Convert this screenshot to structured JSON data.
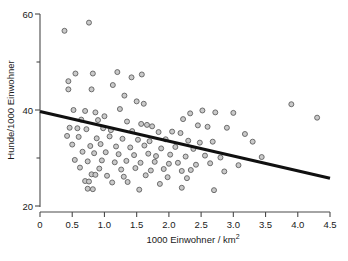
{
  "chart_data": {
    "type": "scatter",
    "title": "",
    "xlabel": "1000 Einwohner / km",
    "xlabel_sup": "2",
    "ylabel": "Hunde/1000 Einwohner",
    "xlim": [
      0,
      4.5
    ],
    "ylim": [
      18,
      61
    ],
    "grid": false,
    "legend": null,
    "xticks": [
      0,
      0.5,
      1.0,
      1.5,
      2.0,
      2.5,
      3.0,
      3.5,
      4.0,
      4.5
    ],
    "xticklabels": [
      "0",
      "0.5",
      "1.0",
      "1.5",
      "2.0",
      "2.5",
      "3.0",
      "3.5",
      "4.0",
      "4.5"
    ],
    "yticks": [
      20,
      40,
      60
    ],
    "yticklabels": [
      "20",
      "40",
      "60"
    ],
    "y_minor_ticks": [
      30,
      50
    ],
    "marker": "open-circle",
    "marker_fill": "#c9c9c9",
    "marker_edge": "#585858",
    "trendline": {
      "label": "regression-line",
      "color": "#101010",
      "x": [
        0.0,
        4.5
      ],
      "y": [
        39.7,
        25.8
      ]
    },
    "points": [
      {
        "x": 0.38,
        "y": 56.5
      },
      {
        "x": 0.76,
        "y": 58.2
      },
      {
        "x": 0.55,
        "y": 47.6
      },
      {
        "x": 0.44,
        "y": 46.0
      },
      {
        "x": 0.44,
        "y": 44.3
      },
      {
        "x": 0.82,
        "y": 47.6
      },
      {
        "x": 0.8,
        "y": 44.3
      },
      {
        "x": 1.2,
        "y": 47.9
      },
      {
        "x": 1.13,
        "y": 45.2
      },
      {
        "x": 1.58,
        "y": 47.4
      },
      {
        "x": 1.42,
        "y": 46.8
      },
      {
        "x": 1.31,
        "y": 43.0
      },
      {
        "x": 1.5,
        "y": 41.8
      },
      {
        "x": 1.61,
        "y": 41.3
      },
      {
        "x": 3.9,
        "y": 41.2
      },
      {
        "x": 0.52,
        "y": 40.0
      },
      {
        "x": 0.7,
        "y": 39.8
      },
      {
        "x": 0.86,
        "y": 39.5
      },
      {
        "x": 1.0,
        "y": 38.7
      },
      {
        "x": 1.24,
        "y": 40.2
      },
      {
        "x": 2.33,
        "y": 39.3
      },
      {
        "x": 2.52,
        "y": 39.9
      },
      {
        "x": 2.72,
        "y": 39.5
      },
      {
        "x": 3.0,
        "y": 39.4
      },
      {
        "x": 2.22,
        "y": 38.1
      },
      {
        "x": 4.3,
        "y": 38.4
      },
      {
        "x": 0.64,
        "y": 38.0
      },
      {
        "x": 0.9,
        "y": 37.9
      },
      {
        "x": 1.35,
        "y": 37.6
      },
      {
        "x": 1.57,
        "y": 37.1
      },
      {
        "x": 1.66,
        "y": 36.9
      },
      {
        "x": 1.74,
        "y": 36.6
      },
      {
        "x": 2.45,
        "y": 36.8
      },
      {
        "x": 2.6,
        "y": 36.5
      },
      {
        "x": 0.46,
        "y": 36.3
      },
      {
        "x": 0.58,
        "y": 36.2
      },
      {
        "x": 0.72,
        "y": 36.0
      },
      {
        "x": 0.98,
        "y": 36.2
      },
      {
        "x": 1.1,
        "y": 35.8
      },
      {
        "x": 1.43,
        "y": 35.6
      },
      {
        "x": 1.84,
        "y": 35.4
      },
      {
        "x": 2.05,
        "y": 35.5
      },
      {
        "x": 2.18,
        "y": 35.2
      },
      {
        "x": 2.9,
        "y": 36.3
      },
      {
        "x": 3.18,
        "y": 35.0
      },
      {
        "x": 0.42,
        "y": 34.6
      },
      {
        "x": 0.6,
        "y": 34.4
      },
      {
        "x": 0.88,
        "y": 34.1
      },
      {
        "x": 1.08,
        "y": 34.5
      },
      {
        "x": 1.28,
        "y": 34.0
      },
      {
        "x": 1.52,
        "y": 33.8
      },
      {
        "x": 1.7,
        "y": 33.5
      },
      {
        "x": 1.95,
        "y": 33.9
      },
      {
        "x": 2.3,
        "y": 33.6
      },
      {
        "x": 2.48,
        "y": 33.2
      },
      {
        "x": 2.68,
        "y": 33.4
      },
      {
        "x": 3.3,
        "y": 33.4
      },
      {
        "x": 0.5,
        "y": 32.8
      },
      {
        "x": 0.78,
        "y": 32.5
      },
      {
        "x": 0.94,
        "y": 32.9
      },
      {
        "x": 1.18,
        "y": 32.4
      },
      {
        "x": 1.4,
        "y": 32.2
      },
      {
        "x": 1.62,
        "y": 32.6
      },
      {
        "x": 1.88,
        "y": 32.0
      },
      {
        "x": 2.1,
        "y": 32.3
      },
      {
        "x": 2.38,
        "y": 31.9
      },
      {
        "x": 0.66,
        "y": 31.3
      },
      {
        "x": 0.84,
        "y": 31.0
      },
      {
        "x": 1.02,
        "y": 31.2
      },
      {
        "x": 1.22,
        "y": 30.8
      },
      {
        "x": 1.46,
        "y": 30.6
      },
      {
        "x": 1.68,
        "y": 30.9
      },
      {
        "x": 1.8,
        "y": 30.4
      },
      {
        "x": 2.02,
        "y": 30.7
      },
      {
        "x": 2.26,
        "y": 30.3
      },
      {
        "x": 2.56,
        "y": 30.5
      },
      {
        "x": 2.8,
        "y": 30.1
      },
      {
        "x": 3.44,
        "y": 30.2
      },
      {
        "x": 0.54,
        "y": 29.6
      },
      {
        "x": 0.74,
        "y": 29.3
      },
      {
        "x": 0.96,
        "y": 29.5
      },
      {
        "x": 1.16,
        "y": 29.1
      },
      {
        "x": 1.34,
        "y": 29.4
      },
      {
        "x": 1.56,
        "y": 29.0
      },
      {
        "x": 1.78,
        "y": 29.2
      },
      {
        "x": 2.0,
        "y": 28.8
      },
      {
        "x": 2.14,
        "y": 29.0
      },
      {
        "x": 2.42,
        "y": 28.6
      },
      {
        "x": 2.64,
        "y": 28.9
      },
      {
        "x": 3.08,
        "y": 28.5
      },
      {
        "x": 0.62,
        "y": 28.0
      },
      {
        "x": 0.92,
        "y": 27.8
      },
      {
        "x": 1.26,
        "y": 27.6
      },
      {
        "x": 1.48,
        "y": 27.9
      },
      {
        "x": 1.72,
        "y": 27.4
      },
      {
        "x": 1.92,
        "y": 27.7
      },
      {
        "x": 2.2,
        "y": 27.3
      },
      {
        "x": 2.34,
        "y": 27.5
      },
      {
        "x": 2.86,
        "y": 27.2
      },
      {
        "x": 0.8,
        "y": 26.6
      },
      {
        "x": 0.86,
        "y": 26.5
      },
      {
        "x": 1.04,
        "y": 26.3
      },
      {
        "x": 1.3,
        "y": 26.1
      },
      {
        "x": 1.64,
        "y": 26.4
      },
      {
        "x": 1.98,
        "y": 26.0
      },
      {
        "x": 2.28,
        "y": 25.8
      },
      {
        "x": 0.7,
        "y": 25.2
      },
      {
        "x": 0.76,
        "y": 25.1
      },
      {
        "x": 1.12,
        "y": 24.9
      },
      {
        "x": 1.36,
        "y": 25.0
      },
      {
        "x": 1.86,
        "y": 24.6
      },
      {
        "x": 0.74,
        "y": 23.6
      },
      {
        "x": 0.82,
        "y": 23.5
      },
      {
        "x": 1.54,
        "y": 23.4
      },
      {
        "x": 2.2,
        "y": 23.8
      },
      {
        "x": 2.7,
        "y": 23.3
      }
    ]
  }
}
